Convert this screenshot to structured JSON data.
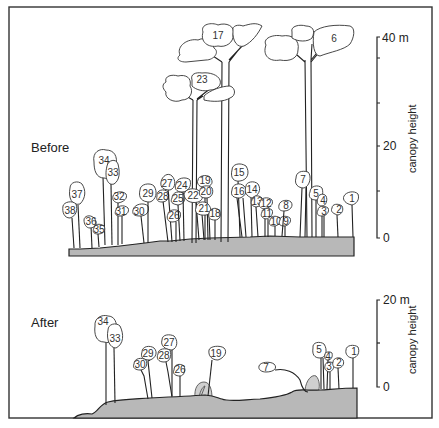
{
  "panels": {
    "before": {
      "label": "Before",
      "scale": {
        "top_label": "40 m",
        "mid_label": "20",
        "bottom_label": "0",
        "axis_title": "canopy height"
      },
      "tree_numbers": [
        "1",
        "2",
        "3",
        "4",
        "5",
        "6",
        "7",
        "8",
        "9",
        "10",
        "11",
        "12",
        "13",
        "14",
        "15",
        "16",
        "17",
        "18",
        "19",
        "20",
        "21",
        "22",
        "23",
        "24",
        "25",
        "26",
        "27",
        "28",
        "29",
        "30",
        "31",
        "32",
        "33",
        "34",
        "35",
        "36",
        "37",
        "38"
      ]
    },
    "after": {
      "label": "After",
      "scale": {
        "top_label": "20 m",
        "bottom_label": "0",
        "axis_title": "canopy height"
      },
      "tree_numbers": [
        "1",
        "2",
        "3",
        "4",
        "5",
        "7",
        "19",
        "26",
        "27",
        "28",
        "29",
        "30",
        "33",
        "34"
      ]
    }
  }
}
